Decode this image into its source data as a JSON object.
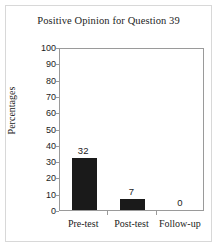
{
  "chart_data": {
    "type": "bar",
    "title": "Positive Opinion for Question 39",
    "xlabel": "",
    "ylabel": "Percentages",
    "categories": [
      "Pre-test",
      "Post-test",
      "Follow-up"
    ],
    "values": [
      32,
      7,
      0
    ],
    "data_labels": [
      "32",
      "7",
      "0"
    ],
    "ylim": [
      0,
      100
    ],
    "ytick_step": 10,
    "ytick_labels": [
      "100",
      "90",
      "80",
      "70",
      "60",
      "50",
      "40",
      "30",
      "20",
      "10",
      "0"
    ],
    "grid": false,
    "legend": null,
    "bar_color": "#1a1a1a",
    "axis_color": "#9a9a9a",
    "frame_color": "#d8d8d8",
    "text_color": "#1c1c1c"
  }
}
